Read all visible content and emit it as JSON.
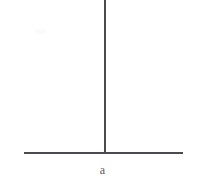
{
  "figure": {
    "type": "line-diagram",
    "background_color": "#ffffff",
    "stroke_color": "#4a4a52",
    "labels": {
      "baseline": "a"
    },
    "geometry": {
      "vertical_line": {
        "x": 104,
        "y_top": 0,
        "y_bottom": 153,
        "thickness": 1.6
      },
      "horizontal_line": {
        "y": 152,
        "x_left": 24,
        "x_right": 183,
        "thickness": 1.6
      },
      "junction": {
        "x": 104,
        "y": 152
      }
    }
  }
}
